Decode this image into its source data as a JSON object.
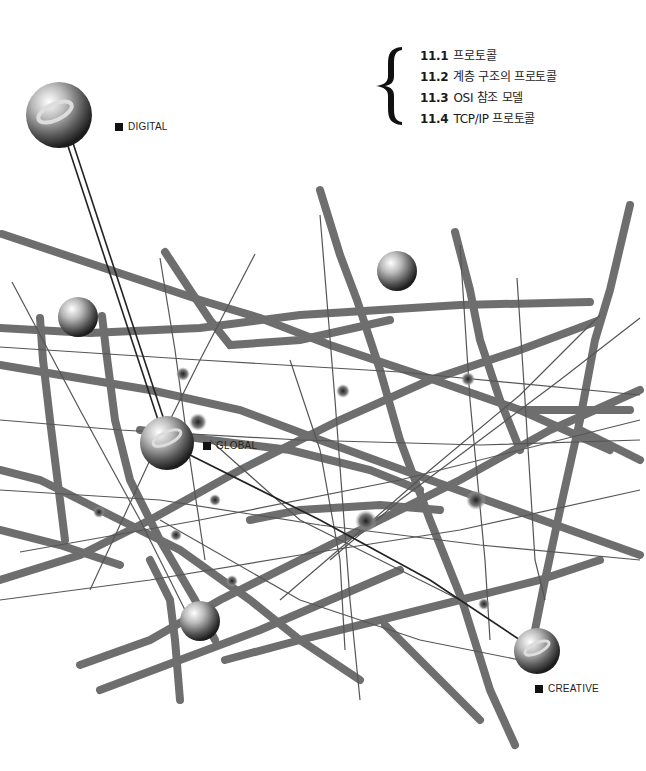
{
  "toc": {
    "items": [
      {
        "num": "11.1",
        "title": "프로토콜"
      },
      {
        "num": "11.2",
        "title": "계층 구조의 프로토콜"
      },
      {
        "num": "11.3",
        "title": "OSI 참조 모델"
      },
      {
        "num": "11.4",
        "title": "TCP/IP 프로토콜"
      }
    ]
  },
  "labels": {
    "digital": "DIGITAL",
    "global": "GLOBAL",
    "creative": "CREATIVE"
  },
  "colors": {
    "strut": "#6e6e6e",
    "thin_line": "#444444",
    "background": "#ffffff"
  }
}
